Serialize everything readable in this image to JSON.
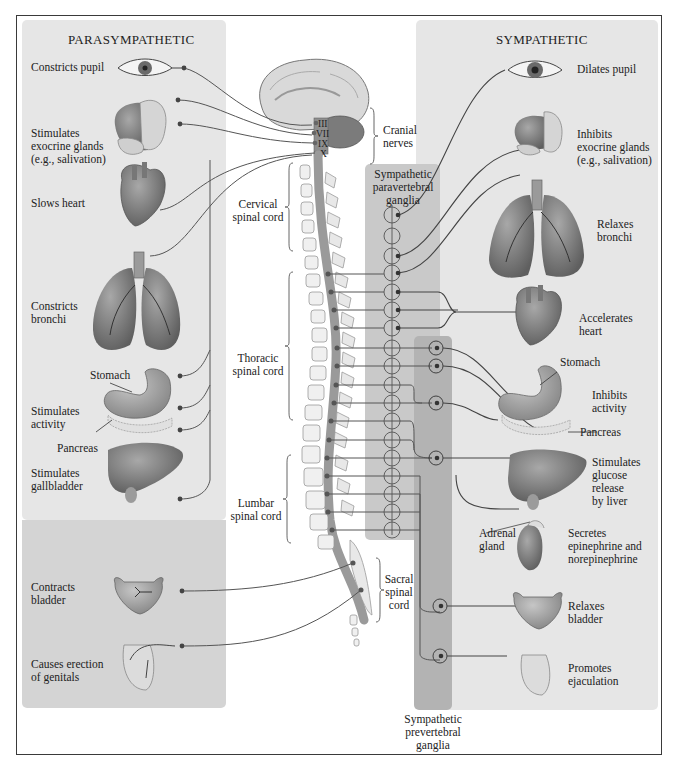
{
  "figure": {
    "colors": {
      "panel_light": "#e4e4e4",
      "panel_mid": "#d2d2d2",
      "ganglia_para": "#c8c8c8",
      "ganglia_prev": "#b4b4b4",
      "organ_fill": "#8c8c8c",
      "organ_dark": "#5e5e5e",
      "spinal_cord": "#a9a9a9",
      "nerve_line": "#555555",
      "frame": "#3a3a3a"
    }
  },
  "parasympathetic": {
    "title": "PARASYMPATHETIC",
    "effects": [
      {
        "label": "Constricts pupil",
        "organ": "eye"
      },
      {
        "label": "Stimulates\nexocrine glands\n(e.g., salivation)",
        "organ": "salivary-glands"
      },
      {
        "label": "Slows heart",
        "organ": "heart"
      },
      {
        "label": "Constricts\nbronchi",
        "organ": "lungs"
      },
      {
        "label": "Stimulates\nactivity",
        "organ": "stomach"
      },
      {
        "label": "Stimulates\ngallbladder",
        "organ": "liver"
      },
      {
        "label": "Contracts\nbladder",
        "organ": "bladder"
      },
      {
        "label": "Causes erection\nof genitals",
        "organ": "genitals"
      }
    ],
    "organ_labels": {
      "stomach": "Stomach",
      "pancreas": "Pancreas"
    }
  },
  "sympathetic": {
    "title": "SYMPATHETIC",
    "effects": [
      {
        "label": "Dilates pupil",
        "organ": "eye"
      },
      {
        "label": "Inhibits\nexocrine glands\n(e.g., salivation)",
        "organ": "salivary-glands"
      },
      {
        "label": "Relaxes\nbronchi",
        "organ": "lungs"
      },
      {
        "label": "Accelerates\nheart",
        "organ": "heart"
      },
      {
        "label": "Inhibits\nactivity",
        "organ": "stomach"
      },
      {
        "label": "Stimulates\nglucose\nrelease\nby liver",
        "organ": "liver"
      },
      {
        "label": "Secretes\nepinephrine and\nnorepinephrine",
        "organ": "adrenal"
      },
      {
        "label": "Relaxes\nbladder",
        "organ": "bladder"
      },
      {
        "label": "Promotes\nejaculation",
        "organ": "genitals"
      }
    ],
    "organ_labels": {
      "stomach": "Stomach",
      "pancreas": "Pancreas",
      "adrenal": "Adrenal\ngland"
    }
  },
  "cns": {
    "cranial_nerves": [
      "III",
      "VII",
      "IX",
      "X"
    ],
    "regions": {
      "cranial": "Cranial\nnerves",
      "cervical": "Cervical\nspinal cord",
      "thoracic": "Thoracic\nspinal cord",
      "lumbar": "Lumbar\nspinal cord",
      "sacral": "Sacral\nspinal\ncord"
    }
  },
  "ganglia": {
    "paravertebral": "Sympathetic\nparavertebral\nganglia",
    "prevertebral": "Sympathetic\nprevertebral\nganglia"
  }
}
